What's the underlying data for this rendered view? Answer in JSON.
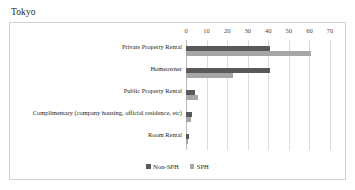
{
  "figure": {
    "title": "Tokyo"
  },
  "legend": {
    "position": "bottom-center",
    "entries": [
      {
        "label": "Non-SPH",
        "color": "#595959"
      },
      {
        "label": "SPH",
        "color": "#a6a6a6"
      }
    ]
  },
  "chart_data": {
    "type": "bar",
    "orientation": "horizontal",
    "grouped": true,
    "title": "Tokyo",
    "xlabel": "",
    "ylabel": "",
    "xlim": [
      0,
      70
    ],
    "xticks": [
      0,
      10,
      20,
      30,
      40,
      50,
      60,
      70
    ],
    "xtick_labels": [
      "0",
      "10",
      "20",
      "30",
      "40",
      "50",
      "60",
      "70"
    ],
    "grid": true,
    "grid_axis": "x",
    "legend": [
      "Non-SPH",
      "SPH"
    ],
    "categories": [
      "Private Property Rental",
      "Homeowner",
      "Public Property Rental",
      "Complimentary (company housing, official residence, etc)",
      "Room Rental"
    ],
    "series": [
      {
        "name": "Non-SPH",
        "color": "#595959",
        "values": [
          41,
          41,
          4.5,
          3,
          1.5
        ]
      },
      {
        "name": "SPH",
        "color": "#a6a6a6",
        "values": [
          61,
          23,
          6,
          2.5,
          1
        ]
      }
    ]
  }
}
